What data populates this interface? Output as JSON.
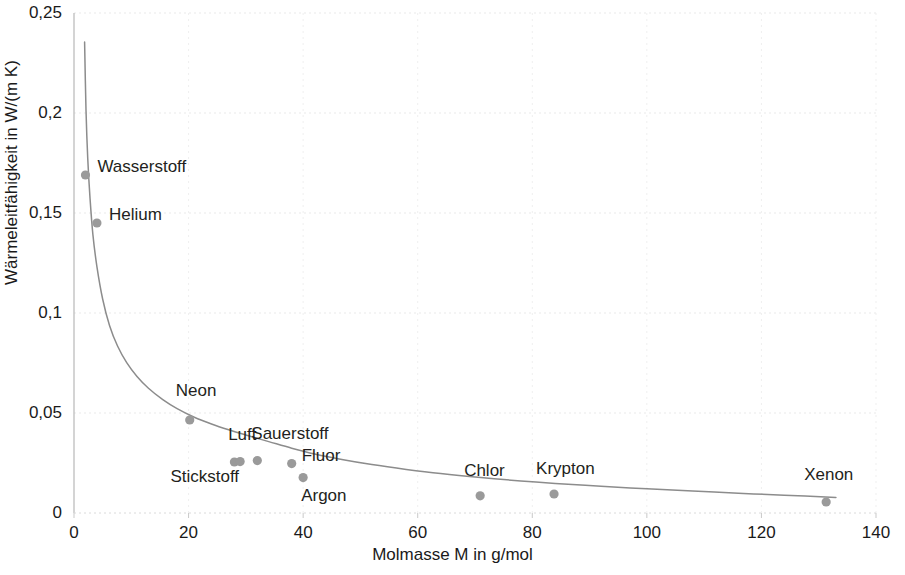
{
  "chart_data": {
    "type": "scatter",
    "title": "",
    "xlabel": "Molmasse M in g/mol",
    "ylabel": "Wärmeleitfähigkeit in W/(m K)",
    "xlim": [
      0,
      140
    ],
    "ylim": [
      0,
      0.25
    ],
    "xticks": [
      0,
      20,
      40,
      60,
      80,
      100,
      120,
      140
    ],
    "xtick_labels": [
      "0",
      "20",
      "40",
      "60",
      "80",
      "100",
      "120",
      "140"
    ],
    "yticks": [
      0,
      0.05,
      0.1,
      0.15,
      0.2,
      0.25
    ],
    "ytick_labels": [
      "0",
      "0,05",
      "0,1",
      "0,15",
      "0,2",
      "0,25"
    ],
    "grid": "faint-both",
    "legend": "none",
    "marker_color": "#9a9a9a",
    "curve_color": "#8c8c8c",
    "axis_color": "#b8b8b8",
    "points": [
      {
        "label": "Wasserstoff",
        "x": 2.0,
        "y": 0.169,
        "label_dx": 12,
        "label_dy": -9
      },
      {
        "label": "Helium",
        "x": 4.0,
        "y": 0.145,
        "label_dx": 12,
        "label_dy": -9
      },
      {
        "label": "Neon",
        "x": 20.2,
        "y": 0.0465,
        "label_dx": -14,
        "label_dy": -30
      },
      {
        "label": "Stickstoff",
        "x": 28.0,
        "y": 0.0255,
        "label_dx": -64,
        "label_dy": 14
      },
      {
        "label": "Luft",
        "x": 29.0,
        "y": 0.0257,
        "label_dx": -12,
        "label_dy": -28
      },
      {
        "label": "Sauerstoff",
        "x": 32.0,
        "y": 0.0262,
        "label_dx": -6,
        "label_dy": -28
      },
      {
        "label": "Fluor",
        "x": 38.0,
        "y": 0.0247,
        "label_dx": 10,
        "label_dy": -9
      },
      {
        "label": "Argon",
        "x": 40.0,
        "y": 0.0177,
        "label_dx": -2,
        "label_dy": 17
      },
      {
        "label": "Chlor",
        "x": 70.9,
        "y": 0.0086,
        "label_dx": -16,
        "label_dy": -26
      },
      {
        "label": "Krypton",
        "x": 83.8,
        "y": 0.0095,
        "label_dx": -18,
        "label_dy": -26
      },
      {
        "label": "Xenon",
        "x": 131.3,
        "y": 0.0055,
        "label_dx": -22,
        "label_dy": -28
      }
    ],
    "trend_curve": {
      "description": "Abfallende Ausgleichskurve (Potenzfunktion) durch die Messpunkte",
      "x_start": 1.85,
      "x_end": 133.0,
      "points_xy": [
        [
          1.85,
          0.2355
        ],
        [
          2.1,
          0.201
        ],
        [
          2.4,
          0.1772
        ],
        [
          2.8,
          0.1573
        ],
        [
          3.3,
          0.1392
        ],
        [
          4.0,
          0.1232
        ],
        [
          5.0,
          0.107
        ],
        [
          6.2,
          0.0938
        ],
        [
          7.6,
          0.0835
        ],
        [
          9.2,
          0.0752
        ],
        [
          11.0,
          0.0683
        ],
        [
          13.0,
          0.0624
        ],
        [
          15.5,
          0.0567
        ],
        [
          18.0,
          0.0522
        ],
        [
          21.0,
          0.0479
        ],
        [
          24.0,
          0.0445
        ],
        [
          27.0,
          0.0416
        ],
        [
          30.0,
          0.039
        ],
        [
          34.0,
          0.0357
        ],
        [
          38.0,
          0.0324
        ],
        [
          42.0,
          0.0295
        ],
        [
          47.0,
          0.0266
        ],
        [
          52.0,
          0.0242
        ],
        [
          58.0,
          0.0218
        ],
        [
          64.0,
          0.0197
        ],
        [
          71.0,
          0.0177
        ],
        [
          78.0,
          0.016
        ],
        [
          84.0,
          0.0148
        ],
        [
          92.0,
          0.0134
        ],
        [
          100.0,
          0.0121
        ],
        [
          108.0,
          0.011
        ],
        [
          116.0,
          0.0099
        ],
        [
          124.0,
          0.0089
        ],
        [
          133.0,
          0.0078
        ]
      ]
    }
  }
}
